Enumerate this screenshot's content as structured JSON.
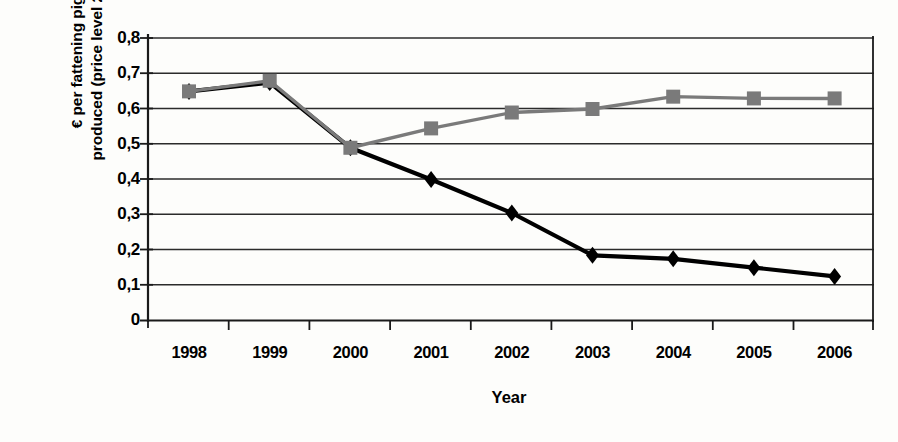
{
  "chart_data": {
    "type": "line",
    "title": "",
    "xlabel": "Year",
    "ylabel": "€ per fattening pig produced (price level 2006)",
    "ylabel_lines": [
      "€ per fattening pig",
      "produced (price level 2006)"
    ],
    "categories": [
      "1998",
      "1999",
      "2000",
      "2001",
      "2002",
      "2003",
      "2004",
      "2005",
      "2006"
    ],
    "ylim": [
      0,
      0.8
    ],
    "ytick_values": [
      0,
      0.1,
      0.2,
      0.3,
      0.4,
      0.5,
      0.6,
      0.7,
      0.8
    ],
    "ytick_labels": [
      "0",
      "0,1",
      "0,2",
      "0,3",
      "0,4",
      "0,5",
      "0,6",
      "0,7",
      "0,8"
    ],
    "grid": true,
    "legend": "none",
    "decimal_separator": ",",
    "series": [
      {
        "name": "series-black-diamond",
        "color": "#000000",
        "marker": "diamond",
        "values": [
          0.65,
          0.675,
          0.49,
          0.4,
          0.305,
          0.185,
          0.175,
          0.15,
          0.125
        ]
      },
      {
        "name": "series-gray-square",
        "color": "#7a7a7a",
        "marker": "square",
        "values": [
          0.65,
          0.68,
          0.49,
          0.545,
          0.59,
          0.6,
          0.635,
          0.63,
          0.63
        ]
      }
    ]
  },
  "axes": {
    "y_title_line1": "€ per fattening pig",
    "y_title_line2": "produced (price level 2006)",
    "x_title": "Year"
  },
  "colors": {
    "background": "#fdfdfb",
    "axis": "#1a1a1a",
    "grid": "#2b2b2b",
    "series_primary": "#000000",
    "series_secondary": "#7a7a7a"
  }
}
